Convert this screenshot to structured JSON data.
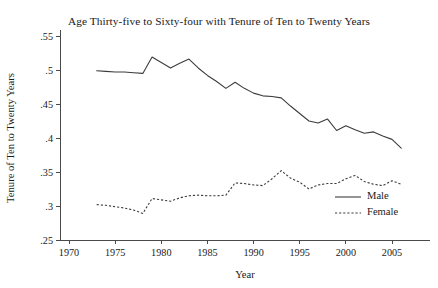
{
  "chart_data": {
    "type": "line",
    "title": "Age Thirty-five to Sixty-four with Tenure of Ten to Twenty Years",
    "xlabel": "Year",
    "ylabel": "Tenure of Ten to Twenty Years",
    "xlim": [
      1969,
      2007
    ],
    "ylim": [
      0.24,
      0.56
    ],
    "xticks": [
      1970,
      1975,
      1980,
      1985,
      1990,
      1995,
      2000,
      2005
    ],
    "xtick_labels": [
      "1970",
      "1975",
      "1980",
      "1985",
      "1990",
      "1995",
      "2000",
      "2005"
    ],
    "yticks": [
      0.25,
      0.3,
      0.35,
      0.4,
      0.45,
      0.5,
      0.55
    ],
    "ytick_labels": [
      ".25",
      ".3",
      ".35",
      ".4",
      ".45",
      ".5",
      ".55"
    ],
    "grid": false,
    "legend_position": "lower-right",
    "x": [
      1973,
      1974,
      1975,
      1976,
      1977,
      1978,
      1979,
      1980,
      1981,
      1982,
      1983,
      1984,
      1985,
      1986,
      1987,
      1988,
      1989,
      1990,
      1991,
      1992,
      1993,
      1994,
      1995,
      1996,
      1997,
      1998,
      1999,
      2000,
      2001,
      2002,
      2003,
      2004,
      2005,
      2006
    ],
    "series": [
      {
        "name": "Male",
        "style": "solid",
        "color": "#3c3c3c",
        "values": [
          0.499,
          0.498,
          0.497,
          0.497,
          0.496,
          0.495,
          0.519,
          0.511,
          0.503,
          0.51,
          0.516,
          0.503,
          0.492,
          0.483,
          0.473,
          0.482,
          0.473,
          0.466,
          0.462,
          0.461,
          0.459,
          0.447,
          0.436,
          0.425,
          0.422,
          0.428,
          0.411,
          0.418,
          0.412,
          0.407,
          0.409,
          0.403,
          0.398,
          0.385
        ]
      },
      {
        "name": "Female",
        "style": "dashed",
        "color": "#3c3c3c",
        "values": [
          0.302,
          0.301,
          0.299,
          0.297,
          0.294,
          0.289,
          0.311,
          0.309,
          0.307,
          0.312,
          0.315,
          0.316,
          0.315,
          0.315,
          0.316,
          0.334,
          0.333,
          0.331,
          0.33,
          0.34,
          0.352,
          0.341,
          0.335,
          0.325,
          0.331,
          0.333,
          0.333,
          0.34,
          0.345,
          0.336,
          0.332,
          0.33,
          0.337,
          0.332
        ]
      }
    ]
  },
  "legend": {
    "entries": [
      {
        "label": "Male"
      },
      {
        "label": "Female"
      }
    ]
  }
}
